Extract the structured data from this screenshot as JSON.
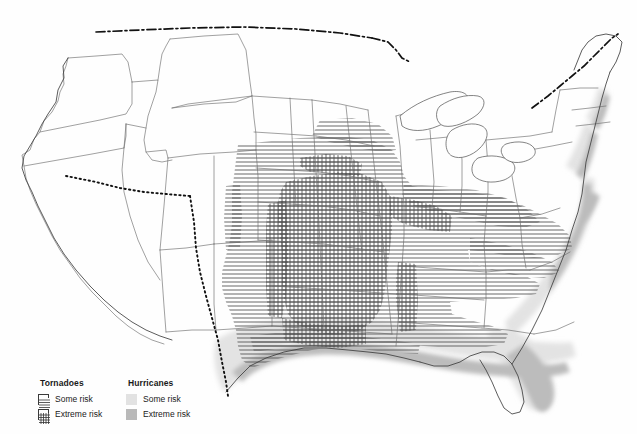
{
  "map": {
    "title": "United States tornado and hurricane risk map",
    "region": "Contiguous United States",
    "background_color": "#fefefe",
    "state_border_color": "#6b6b6b",
    "coast_outline_color": "#4a4a4a",
    "intl_border_color": "#111111",
    "hatch_color": "#4d4d4d"
  },
  "legend": {
    "tornadoes": {
      "title": "Tornadoes",
      "items": [
        {
          "label": "Some risk",
          "pattern": "horizontal-lines",
          "swatch_color": "#ffffff"
        },
        {
          "label": "Extreme risk",
          "pattern": "crosshatch",
          "swatch_color": "#ffffff"
        }
      ]
    },
    "hurricanes": {
      "title": "Hurricanes",
      "items": [
        {
          "label": "Some risk",
          "pattern": "solid-fill",
          "swatch_color": "#e2e2e2"
        },
        {
          "label": "Extreme risk",
          "pattern": "solid-fill",
          "swatch_color": "#b9b9b9"
        }
      ]
    }
  },
  "risk_zones": {
    "tornado_some_risk": {
      "label": "Some risk",
      "description": "Broad horizontal-hatched band across the Great Plains, Midwest and Southeast",
      "states": [
        "North Dakota",
        "South Dakota",
        "Nebraska",
        "Kansas",
        "Oklahoma",
        "Texas",
        "Minnesota",
        "Iowa",
        "Missouri",
        "Arkansas",
        "Louisiana",
        "Wisconsin",
        "Illinois",
        "Indiana",
        "Ohio",
        "Kentucky",
        "Tennessee",
        "Mississippi",
        "Alabama",
        "Georgia",
        "South Carolina",
        "North Carolina",
        "Virginia",
        "Colorado"
      ]
    },
    "tornado_extreme_risk": {
      "label": "Extreme risk",
      "description": "Crosshatched core of Tornado Alley",
      "states": [
        "Kansas",
        "Oklahoma",
        "Nebraska",
        "Iowa",
        "Missouri",
        "northern Texas",
        "Illinois",
        "Arkansas",
        "Mississippi",
        "Alabama"
      ]
    },
    "hurricane_some_risk": {
      "label": "Some risk",
      "description": "Light gray inland band paralleling the Gulf and Atlantic coasts",
      "states": [
        "Texas",
        "Louisiana",
        "Mississippi",
        "Alabama",
        "Florida",
        "Georgia",
        "South Carolina",
        "North Carolina",
        "Virginia",
        "Maryland",
        "Delaware",
        "New Jersey",
        "New York",
        "Connecticut",
        "Rhode Island",
        "Massachusetts"
      ]
    },
    "hurricane_extreme_risk": {
      "label": "Extreme risk",
      "description": "Darker gray coastal strip at the immediate shoreline",
      "states": [
        "south Texas coast",
        "Louisiana coast",
        "Florida coast",
        "Outer Banks of North Carolina",
        "Cape Cod"
      ]
    }
  }
}
